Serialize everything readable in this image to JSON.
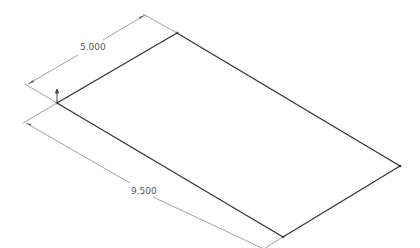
{
  "drawing": {
    "type": "isometric-sketch",
    "dimensions": [
      {
        "label": "5.000",
        "name": "width-dimension"
      },
      {
        "label": "9.500",
        "name": "length-dimension"
      }
    ],
    "colors": {
      "edge": "#333333",
      "dimension": "#888888",
      "text": "#555555"
    }
  }
}
